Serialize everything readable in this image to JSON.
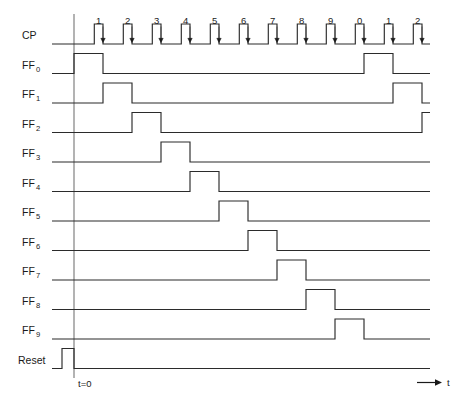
{
  "figure": {
    "kind": "timing-diagram",
    "background_color": "#ffffff",
    "wave_color": "#2b2b2b",
    "axis_color": "#6e6e6e",
    "text_color": "#1a1a1a"
  },
  "geometry": {
    "origin_x": 74,
    "plot_right": 430,
    "clock_period": 29.0,
    "pulse_high_fraction": 0.3,
    "row_height": 29.5,
    "first_row_baseline_y": 44,
    "level_swing": 20,
    "axis_top_y": 14,
    "axis_bottom_y": 378
  },
  "clock": {
    "label": "CP",
    "label_sub": "",
    "tick_labels": [
      "1",
      "2",
      "3",
      "4",
      "5",
      "6",
      "7",
      "8",
      "9",
      "0",
      "1",
      "2"
    ],
    "pulse_count": 13,
    "trigger_edge": "falling",
    "edge_marker": "down-arrow"
  },
  "signals": [
    {
      "name": "FF0",
      "label": "FF",
      "sub": "0",
      "high_start_clock": 0,
      "high_end_clock": 1,
      "wrap_high_start_clock": 10,
      "wrap_high_end_clock": 11
    },
    {
      "name": "FF1",
      "label": "FF",
      "sub": "1",
      "high_start_clock": 1,
      "high_end_clock": 2,
      "wrap_high_start_clock": 11,
      "wrap_high_end_clock": 12
    },
    {
      "name": "FF2",
      "label": "FF",
      "sub": "2",
      "high_start_clock": 2,
      "high_end_clock": 3,
      "wrap_high_start_clock": 12,
      "wrap_high_end_clock": 13
    },
    {
      "name": "FF3",
      "label": "FF",
      "sub": "3",
      "high_start_clock": 3,
      "high_end_clock": 4,
      "wrap_high_start_clock": 13,
      "wrap_high_end_clock": 14
    },
    {
      "name": "FF4",
      "label": "FF",
      "sub": "4",
      "high_start_clock": 4,
      "high_end_clock": 5,
      "wrap_high_start_clock": null,
      "wrap_high_end_clock": null
    },
    {
      "name": "FF5",
      "label": "FF",
      "sub": "5",
      "high_start_clock": 5,
      "high_end_clock": 6,
      "wrap_high_start_clock": null,
      "wrap_high_end_clock": null
    },
    {
      "name": "FF6",
      "label": "FF",
      "sub": "6",
      "high_start_clock": 6,
      "high_end_clock": 7,
      "wrap_high_start_clock": null,
      "wrap_high_end_clock": null
    },
    {
      "name": "FF7",
      "label": "FF",
      "sub": "7",
      "high_start_clock": 7,
      "high_end_clock": 8,
      "wrap_high_start_clock": null,
      "wrap_high_end_clock": null
    },
    {
      "name": "FF8",
      "label": "FF",
      "sub": "8",
      "high_start_clock": 8,
      "high_end_clock": 9,
      "wrap_high_start_clock": null,
      "wrap_high_end_clock": null
    },
    {
      "name": "FF9",
      "label": "FF",
      "sub": "9",
      "high_start_clock": 9,
      "high_end_clock": 10,
      "wrap_high_start_clock": null,
      "wrap_high_end_clock": null
    }
  ],
  "reset": {
    "label": "Reset",
    "sub": "",
    "pulse_start_x": 62,
    "pulse_end_x": 74,
    "active": "before-t0"
  },
  "annotations": {
    "t_zero": "t=0",
    "time_axis": "t"
  },
  "chart_data": {
    "type": "line",
    "xlabel": "t",
    "ylabel": "",
    "x_tick_labels": [
      "1",
      "2",
      "3",
      "4",
      "5",
      "6",
      "7",
      "8",
      "9",
      "0",
      "1",
      "2"
    ],
    "grid": false,
    "legend": "none",
    "series": [
      {
        "name": "CP",
        "values": [
          1,
          1,
          1,
          1,
          1,
          1,
          1,
          1,
          1,
          1,
          1,
          1,
          1
        ]
      },
      {
        "name": "FF0",
        "values": [
          1,
          0,
          0,
          0,
          0,
          0,
          0,
          0,
          0,
          0,
          1,
          0,
          0
        ]
      },
      {
        "name": "FF1",
        "values": [
          0,
          1,
          0,
          0,
          0,
          0,
          0,
          0,
          0,
          0,
          0,
          1,
          0
        ]
      },
      {
        "name": "FF2",
        "values": [
          0,
          0,
          1,
          0,
          0,
          0,
          0,
          0,
          0,
          0,
          0,
          0,
          1
        ]
      },
      {
        "name": "FF3",
        "values": [
          0,
          0,
          0,
          1,
          0,
          0,
          0,
          0,
          0,
          0,
          0,
          0,
          0
        ]
      },
      {
        "name": "FF4",
        "values": [
          0,
          0,
          0,
          0,
          1,
          0,
          0,
          0,
          0,
          0,
          0,
          0,
          0
        ]
      },
      {
        "name": "FF5",
        "values": [
          0,
          0,
          0,
          0,
          0,
          1,
          0,
          0,
          0,
          0,
          0,
          0,
          0
        ]
      },
      {
        "name": "FF6",
        "values": [
          0,
          0,
          0,
          0,
          0,
          0,
          1,
          0,
          0,
          0,
          0,
          0,
          0
        ]
      },
      {
        "name": "FF7",
        "values": [
          0,
          0,
          0,
          0,
          0,
          0,
          0,
          1,
          0,
          0,
          0,
          0,
          0
        ]
      },
      {
        "name": "FF8",
        "values": [
          0,
          0,
          0,
          0,
          0,
          0,
          0,
          0,
          1,
          0,
          0,
          0,
          0
        ]
      },
      {
        "name": "FF9",
        "values": [
          0,
          0,
          0,
          0,
          0,
          0,
          0,
          0,
          0,
          1,
          0,
          0,
          0
        ]
      },
      {
        "name": "Reset",
        "values": [
          0,
          0,
          0,
          0,
          0,
          0,
          0,
          0,
          0,
          0,
          0,
          0,
          0
        ]
      }
    ]
  }
}
